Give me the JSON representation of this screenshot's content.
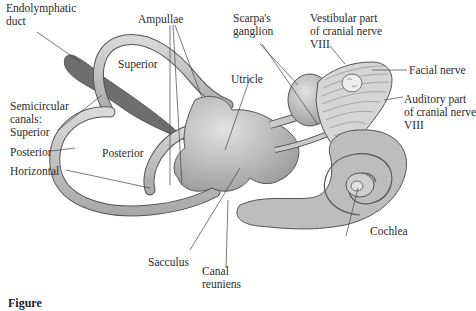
{
  "figure": {
    "type": "anatomical-diagram",
    "caption_visible": "Figure",
    "colors": {
      "canal_fill": "#c8c8c8",
      "canal_stroke": "#555555",
      "duct_fill": "#6e6e6e",
      "nerve_fill": "#d6d6d6",
      "leader_line": "#444444",
      "background": "#ffffff"
    }
  },
  "labels": {
    "endolymphatic_duct": "Endolymphatic\nduct",
    "ampullae": "Ampullae",
    "scarpas_ganglion": "Scarpa's\nganglion",
    "vestibular_nerve": "Vestibular part\nof cranial nerve\nVIII",
    "facial_nerve": "Facial nerve",
    "auditory_nerve": "Auditory part\nof cranial nerve\nVIII",
    "superior_inner": "Superior",
    "utricle": "Utricle",
    "semicircular_canals": "Semicircular\ncanals:",
    "superior": "Superior",
    "posterior": "Posterior",
    "posterior_inner": "Posterior",
    "horizontal": "Horizontal",
    "sacculus": "Sacculus",
    "canal_reuniens": "Canal\nreuniens",
    "cochlea": "Cochlea"
  }
}
